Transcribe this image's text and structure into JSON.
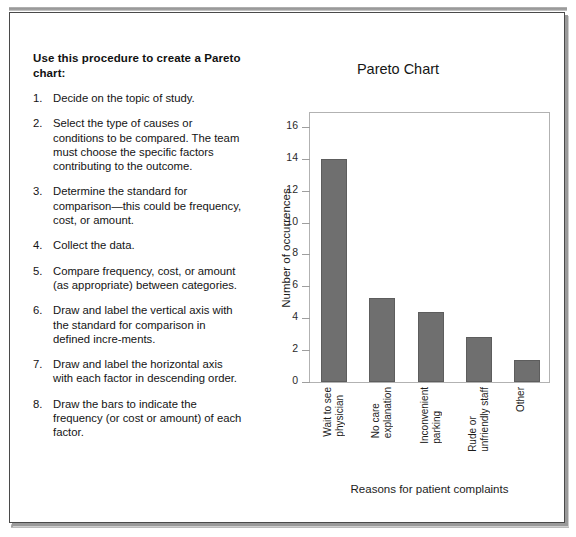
{
  "procedure": {
    "heading": "Use this procedure to create a Pareto chart:",
    "steps": [
      {
        "num": "1.",
        "text": "Decide on the topic of study."
      },
      {
        "num": "2.",
        "text": "Select the type of causes or conditions to be compared. The team must choose the specific factors contributing to the outcome."
      },
      {
        "num": "3.",
        "text": "Determine the standard for comparison—this could be frequency, cost, or amount."
      },
      {
        "num": "4.",
        "text": "Collect the data."
      },
      {
        "num": "5.",
        "text": "Compare frequency, cost, or amount (as appropriate) between categories."
      },
      {
        "num": "6.",
        "text": "Draw and label the vertical axis with the standard for comparison in defined incre-ments."
      },
      {
        "num": "7.",
        "text": "Draw and label the horizontal axis with each factor in descending order."
      },
      {
        "num": "8.",
        "text": "Draw the bars to indicate the frequency (or cost or amount) of each factor."
      }
    ]
  },
  "chart_data": {
    "type": "bar",
    "title": "Pareto Chart",
    "xlabel": "Reasons for patient complaints",
    "ylabel": "Number of occurrences",
    "categories": [
      "Wait to see\nphysician",
      "No care\nexplanation",
      "Inconvenient\nparking",
      "Rude or\nunfriendly staff",
      "Other"
    ],
    "values": [
      14,
      5.3,
      4.4,
      2.8,
      1.4
    ],
    "ylim": [
      0,
      17
    ],
    "yticks": [
      0,
      2,
      4,
      6,
      8,
      10,
      12,
      14,
      16
    ],
    "grid": false,
    "legend": null,
    "bar_color": "#6f6f6f"
  }
}
